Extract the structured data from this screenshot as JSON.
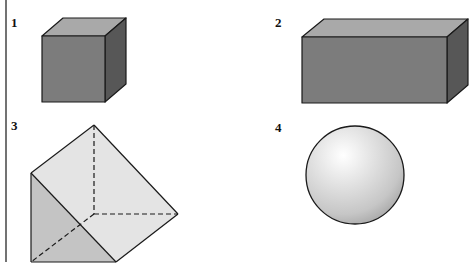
{
  "figure": {
    "shapes": [
      {
        "id": 1,
        "label": "1",
        "name": "cube"
      },
      {
        "id": 2,
        "label": "2",
        "name": "rectangular prism"
      },
      {
        "id": 3,
        "label": "3",
        "name": "triangular prism"
      },
      {
        "id": 4,
        "label": "4",
        "name": "sphere"
      }
    ],
    "colors": {
      "background": "#ffffff",
      "outline": "#1a1a1a",
      "box_front": "#7c7c7c",
      "box_top": "#a9a9a9",
      "box_side": "#575757",
      "prism_light": "#e4e4e4",
      "prism_shaded": "#c4c4c4",
      "sphere_highlight": "#ffffff",
      "sphere_shadow": "#a8a8a8",
      "margin_rule": "#444444"
    }
  }
}
